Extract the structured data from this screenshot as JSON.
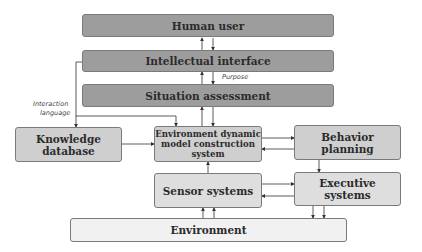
{
  "diagram": {
    "type": "block-diagram",
    "nodes": {
      "human_user": "Human user",
      "intellectual_interface": "Intellectual interface",
      "situation_assessment": "Situation assessment",
      "knowledge_database": "Knowledge database",
      "env_model": "Environment dynamic model construction system",
      "behavior_planning": "Behavior planning",
      "sensor_systems": "Sensor systems",
      "executive_systems": "Executive systems",
      "environment": "Environment"
    },
    "edge_labels": {
      "purpose": "Purpose",
      "interaction_language_1": "Interaction",
      "interaction_language_2": "language"
    },
    "edges": [
      {
        "from": "intellectual_interface",
        "to": "human_user"
      },
      {
        "from": "human_user",
        "to": "intellectual_interface"
      },
      {
        "from": "situation_assessment",
        "to": "intellectual_interface"
      },
      {
        "from": "intellectual_interface",
        "to": "situation_assessment",
        "label": "Purpose"
      },
      {
        "from": "intellectual_interface",
        "to": "knowledge_database",
        "label": "Interaction language"
      },
      {
        "from": "intellectual_interface",
        "to": "env_model"
      },
      {
        "from": "env_model",
        "to": "situation_assessment"
      },
      {
        "from": "situation_assessment",
        "to": "env_model"
      },
      {
        "from": "knowledge_database",
        "to": "env_model"
      },
      {
        "from": "env_model",
        "to": "behavior_planning"
      },
      {
        "from": "behavior_planning",
        "to": "env_model"
      },
      {
        "from": "behavior_planning",
        "to": "executive_systems"
      },
      {
        "from": "sensor_systems",
        "to": "env_model"
      },
      {
        "from": "sensor_systems",
        "to": "executive_systems"
      },
      {
        "from": "executive_systems",
        "to": "sensor_systems"
      },
      {
        "from": "environment",
        "to": "sensor_systems"
      },
      {
        "from": "executive_systems",
        "to": "environment"
      }
    ],
    "colors": {
      "dark": "#9d9d9d",
      "mid": "#cfcfcf",
      "light": "#ececec",
      "line": "#333333"
    }
  },
  "env_model_lines": [
    "Environment dynamic",
    "model construction",
    "system"
  ]
}
